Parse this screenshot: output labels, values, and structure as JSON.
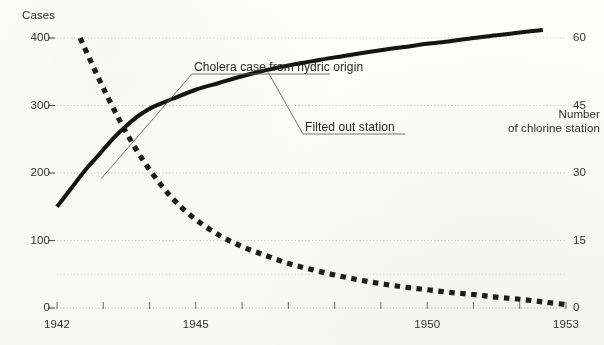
{
  "chart_data": {
    "type": "line",
    "title": "",
    "xlabel": "",
    "ylabel": "Cases",
    "y2label": "Number of chlorine station",
    "xlim": [
      1942,
      1953
    ],
    "ylim": [
      0,
      400
    ],
    "y2lim": [
      0,
      60
    ],
    "grid": true,
    "legend_position": "annotations-inline",
    "x_ticks": [
      1942,
      1943,
      1944,
      1945,
      1946,
      1947,
      1948,
      1949,
      1950,
      1951,
      1952,
      1953
    ],
    "x_tick_labels": [
      "1942",
      "",
      "",
      "1945",
      "",
      "",
      "",
      "",
      "1950",
      "",
      "",
      "1953"
    ],
    "y_ticks": [
      0,
      100,
      200,
      300,
      400
    ],
    "y_tick_labels": [
      "0",
      "100",
      "200",
      "300",
      "400"
    ],
    "y2_ticks": [
      0,
      15,
      30,
      45,
      60
    ],
    "y2_tick_labels": [
      "0",
      "15",
      "30",
      "45",
      "60"
    ],
    "series": [
      {
        "name": "Cholera case from hydric origin",
        "axis": "left",
        "style": "dashed",
        "color": "#1a1a1a",
        "x": [
          1942.5,
          1942.8,
          1943.1,
          1943.4,
          1943.7,
          1944.0,
          1944.3,
          1944.6,
          1945.0,
          1945.5,
          1946.0,
          1946.5,
          1947.0,
          1947.5,
          1948.0,
          1948.5,
          1949.0,
          1949.5,
          1950.0,
          1950.5,
          1951.0,
          1951.5,
          1952.0,
          1952.5,
          1953.0
        ],
        "values": [
          400,
          355,
          312,
          272,
          236,
          205,
          178,
          155,
          131,
          108,
          91,
          78,
          66,
          57,
          49,
          42,
          36,
          31,
          27,
          23,
          20,
          16,
          13,
          9,
          5
        ]
      },
      {
        "name": "Filted out station",
        "axis": "right",
        "style": "solid",
        "color": "#111111",
        "x": [
          1942.0,
          1942.3,
          1942.6,
          1942.9,
          1943.2,
          1943.5,
          1943.8,
          1944.1,
          1944.5,
          1945.0,
          1945.5,
          1946.0,
          1946.5,
          1947.0,
          1947.5,
          1948.0,
          1948.5,
          1949.0,
          1949.5,
          1950.0,
          1950.5,
          1951.0,
          1951.5,
          1952.0,
          1952.5
        ],
        "values": [
          22.5,
          26.5,
          30.5,
          34.0,
          37.5,
          40.5,
          43.0,
          44.8,
          46.5,
          48.5,
          50.0,
          51.5,
          52.8,
          53.9,
          54.8,
          55.7,
          56.5,
          57.3,
          58.0,
          58.7,
          59.3,
          60.0,
          60.6,
          61.2,
          61.8
        ]
      }
    ],
    "annotations": [
      {
        "text": "Cholera case from hydric origin",
        "target_x": 1942.95,
        "target_y_cases": 196
      },
      {
        "text": "Filted out station",
        "target_x": 1946.6,
        "target_y_stations": 53.1
      }
    ]
  },
  "axes": {
    "left_title": "Cases",
    "right_title_line1": "Number",
    "right_title_line2": "of chlorine station"
  },
  "annotations": {
    "cholera": "Cholera case from hydric origin",
    "filtered": "Filted out station"
  }
}
